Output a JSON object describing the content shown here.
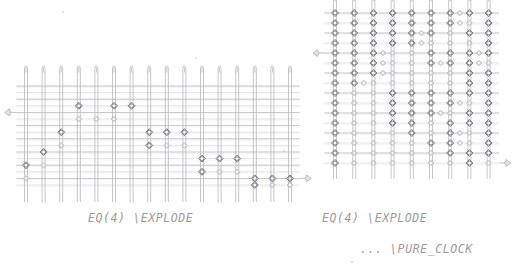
{
  "page": {
    "background": "#ffffff",
    "width": 523,
    "height": 275,
    "kind": "scanned-circuit-diagram"
  },
  "palette": {
    "wire_vertical": "#b9b9bd",
    "wire_horizontal": "#c6c6ca",
    "gate_stroke": "#6e6e74",
    "gate_fill": "#ffffff",
    "gate_light_stroke": "#a8a8ae",
    "marker": "#b0b0b6",
    "text": "#9a9a9e"
  },
  "panels": [
    {
      "id": "left-circuit",
      "name": "EQ(4) EXPLODE circuit",
      "caption_lines": [
        "EQ(4)  \\EXPLODE"
      ],
      "geometry": {
        "x": 26,
        "y": 86,
        "col_count": 16,
        "row_count": 16,
        "col_step": 17.6,
        "row_step": 6.6,
        "wire_top_overhang": 20,
        "wire_bottom_overhang": 17
      },
      "markers": [
        {
          "name": "input-marker",
          "side": "left",
          "row": 4
        },
        {
          "name": "output-marker",
          "side": "right",
          "row": 14
        }
      ],
      "gates": [
        {
          "col": 0,
          "row": 12,
          "size": "big"
        },
        {
          "col": 0,
          "row": 14,
          "size": "small"
        },
        {
          "col": 1,
          "row": 10,
          "size": "big"
        },
        {
          "col": 1,
          "row": 12,
          "size": "small"
        },
        {
          "col": 2,
          "row": 7,
          "size": "big"
        },
        {
          "col": 2,
          "row": 9,
          "size": "small"
        },
        {
          "col": 3,
          "row": 3,
          "size": "big"
        },
        {
          "col": 3,
          "row": 5,
          "size": "small"
        },
        {
          "col": 4,
          "row": 5,
          "size": "small"
        },
        {
          "col": 5,
          "row": 3,
          "size": "big"
        },
        {
          "col": 5,
          "row": 5,
          "size": "small"
        },
        {
          "col": 6,
          "row": 3,
          "size": "big"
        },
        {
          "col": 7,
          "row": 7,
          "size": "big"
        },
        {
          "col": 7,
          "row": 9,
          "size": "big"
        },
        {
          "col": 8,
          "row": 9,
          "size": "small"
        },
        {
          "col": 8,
          "row": 7,
          "size": "big"
        },
        {
          "col": 9,
          "row": 9,
          "size": "small"
        },
        {
          "col": 9,
          "row": 7,
          "size": "big"
        },
        {
          "col": 10,
          "row": 11,
          "size": "big"
        },
        {
          "col": 10,
          "row": 13,
          "size": "big"
        },
        {
          "col": 11,
          "row": 13,
          "size": "small"
        },
        {
          "col": 11,
          "row": 11,
          "size": "big"
        },
        {
          "col": 12,
          "row": 13,
          "size": "small"
        },
        {
          "col": 12,
          "row": 11,
          "size": "big"
        },
        {
          "col": 13,
          "row": 14,
          "size": "big"
        },
        {
          "col": 13,
          "row": 15,
          "size": "big"
        },
        {
          "col": 14,
          "row": 15,
          "size": "small"
        },
        {
          "col": 14,
          "row": 14,
          "size": "big"
        },
        {
          "col": 15,
          "row": 15,
          "size": "small"
        },
        {
          "col": 15,
          "row": 14,
          "size": "big"
        }
      ]
    },
    {
      "id": "right-circuit",
      "name": "EQ(4) EXPLODE PURE_CLOCK circuit",
      "caption_lines": [
        "EQ(4)  \\EXPLODE",
        "...   \\PURE_CLOCK"
      ],
      "geometry": {
        "x": 335,
        "y": 13,
        "col_count": 9,
        "row_count": 16,
        "col_step": 19.2,
        "row_step": 10.0,
        "wire_top_overhang": 18,
        "wire_bottom_overhang": 16
      },
      "markers": [
        {
          "name": "input-marker",
          "side": "left",
          "row": 4
        },
        {
          "name": "output-marker",
          "side": "right",
          "row": 15
        }
      ],
      "gate_matrix": [
        [
          2,
          0,
          2,
          0,
          2,
          0,
          2,
          0,
          2,
          0,
          2,
          0,
          2,
          1,
          2,
          0,
          2,
          0
        ],
        [
          2,
          0,
          2,
          0,
          2,
          0,
          2,
          0,
          2,
          0,
          2,
          0,
          2,
          1,
          1,
          0,
          2,
          0
        ],
        [
          2,
          0,
          2,
          0,
          2,
          0,
          2,
          0,
          2,
          1,
          2,
          0,
          1,
          0,
          2,
          0,
          2,
          0
        ],
        [
          2,
          0,
          2,
          0,
          2,
          0,
          2,
          0,
          2,
          1,
          1,
          0,
          1,
          0,
          1,
          0,
          2,
          0
        ],
        [
          2,
          0,
          2,
          0,
          2,
          1,
          1,
          0,
          1,
          0,
          2,
          0,
          2,
          0,
          2,
          1,
          2,
          0
        ],
        [
          2,
          0,
          2,
          0,
          2,
          1,
          1,
          0,
          1,
          0,
          2,
          1,
          2,
          0,
          2,
          1,
          1,
          0
        ],
        [
          2,
          0,
          2,
          0,
          2,
          1,
          1,
          0,
          1,
          0,
          1,
          0,
          1,
          0,
          2,
          0,
          2,
          0
        ],
        [
          2,
          0,
          2,
          1,
          1,
          0,
          1,
          0,
          1,
          0,
          1,
          0,
          1,
          0,
          2,
          0,
          2,
          0
        ],
        [
          2,
          0,
          1,
          0,
          1,
          0,
          2,
          0,
          2,
          0,
          2,
          0,
          2,
          0,
          2,
          0,
          2,
          0
        ],
        [
          2,
          0,
          1,
          0,
          1,
          0,
          2,
          0,
          2,
          0,
          2,
          0,
          2,
          1,
          1,
          0,
          2,
          0
        ],
        [
          2,
          0,
          1,
          0,
          1,
          0,
          2,
          0,
          2,
          0,
          2,
          1,
          1,
          0,
          2,
          0,
          2,
          0
        ],
        [
          2,
          0,
          1,
          0,
          1,
          0,
          2,
          0,
          2,
          0,
          1,
          0,
          2,
          0,
          2,
          0,
          2,
          0
        ],
        [
          2,
          0,
          1,
          0,
          1,
          0,
          1,
          0,
          2,
          0,
          1,
          0,
          2,
          1,
          1,
          0,
          2,
          0
        ],
        [
          2,
          0,
          1,
          0,
          1,
          0,
          1,
          0,
          1,
          0,
          2,
          0,
          2,
          1,
          1,
          0,
          2,
          0
        ],
        [
          2,
          0,
          1,
          0,
          1,
          0,
          1,
          0,
          1,
          0,
          1,
          0,
          2,
          0,
          2,
          0,
          2,
          0
        ],
        [
          2,
          0,
          1,
          0,
          1,
          0,
          1,
          0,
          1,
          0,
          1,
          0,
          1,
          0,
          2,
          0,
          1,
          0
        ]
      ]
    }
  ],
  "specks": [
    {
      "x": 63,
      "y": 12
    },
    {
      "x": 196,
      "y": 58
    },
    {
      "x": 352,
      "y": 262
    },
    {
      "x": 284,
      "y": 151
    }
  ]
}
